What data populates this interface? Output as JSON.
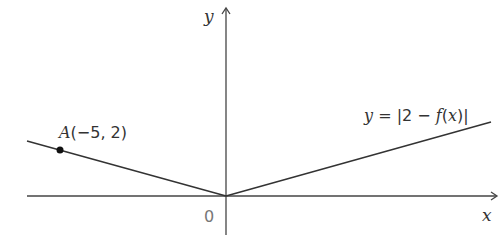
{
  "diagram": {
    "axes": {
      "x_label": "x",
      "y_label": "y",
      "origin_label": "0"
    },
    "curve": {
      "label": "y = |2 − f(x)|",
      "label_parts": {
        "y": "y",
        "eq": " = |2 − ",
        "f": "f",
        "open": "(",
        "x": "x",
        "close": ")|"
      }
    },
    "point_A": {
      "name": "A",
      "coords_text": "(−5, 2)",
      "x": -5,
      "y": 2
    },
    "colors": {
      "line": "#333333",
      "axis": "#444444",
      "origin_label": "#777777"
    }
  }
}
